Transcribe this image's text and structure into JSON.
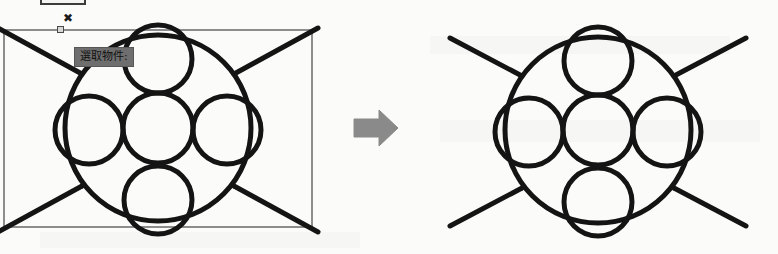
{
  "app": {
    "background_color": "#fbfbfa",
    "ink_color": "#141414",
    "selection_color": "#8d8d8d",
    "tooltip_bg": "#6e6e6e",
    "arrow_color": "#8a8a8a"
  },
  "toolbar": {
    "button_label": ""
  },
  "cursor": {
    "glyph": "✖",
    "name": "crosshair-x-cursor"
  },
  "tooltip": {
    "text": "選取物件:"
  },
  "left_panel": {
    "caption": "",
    "selection_rect": {
      "x": 3,
      "y": 29,
      "width": 310,
      "height": 199
    }
  },
  "arrow": {
    "direction": "right",
    "label": ""
  },
  "right_panel": {
    "caption": ""
  },
  "figure": {
    "outer_circle": {
      "cx": 0,
      "cy": 0,
      "r": 93
    },
    "center_circle": {
      "cx": 0,
      "cy": 0,
      "r": 35
    },
    "satellites": [
      {
        "name": "top-circle",
        "cx": 0,
        "cy": -69,
        "r": 34
      },
      {
        "name": "left-circle",
        "cx": -69,
        "cy": 2,
        "r": 34
      },
      {
        "name": "right-circle",
        "cx": 69,
        "cy": 2,
        "r": 34
      },
      {
        "name": "bottom-circle",
        "cx": 0,
        "cy": 72,
        "r": 34
      }
    ],
    "spokes": [
      {
        "name": "spoke-top-left",
        "angle_deg": 215
      },
      {
        "name": "spoke-top-right",
        "angle_deg": 325
      },
      {
        "name": "spoke-bottom-left",
        "angle_deg": 145
      },
      {
        "name": "spoke-bottom-right",
        "angle_deg": 35
      }
    ]
  }
}
